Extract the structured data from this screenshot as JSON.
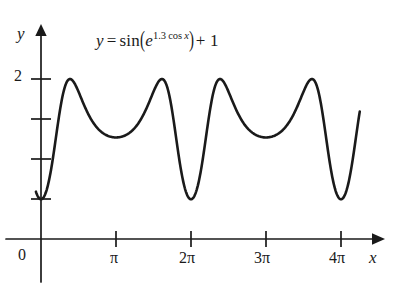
{
  "figure": {
    "kind": "function-graph",
    "background_color": "#ffffff",
    "ink_color": "#1a1a1a",
    "equation": {
      "lhs": "y",
      "relation": "=",
      "function_name": "sin",
      "inner_base": "e",
      "inner_exponent_coefficient": "1.3",
      "inner_exponent_function": "cos",
      "inner_exponent_variable": "x",
      "added_constant": "+ 1",
      "plain_text": "y = sin(e^{1.3 cos x}) + 1"
    },
    "axes": {
      "x_axis_label": "x",
      "y_axis_label": "y",
      "origin_label": "0",
      "x_ticks": [
        {
          "label": "π",
          "value_in_pi": 1
        },
        {
          "label": "2π",
          "value_in_pi": 2
        },
        {
          "label": "3π",
          "value_in_pi": 3
        },
        {
          "label": "4π",
          "value_in_pi": 4
        }
      ],
      "y_ticks": [
        {
          "label": "2",
          "value": 2
        },
        {
          "label": "",
          "value": 1.5
        },
        {
          "label": "",
          "value": 1.0
        },
        {
          "label": "",
          "value": 0.5
        }
      ],
      "x_range_pi": [
        -0.07,
        4.5
      ],
      "y_range": [
        0,
        2.6
      ]
    }
  },
  "chart_data": {
    "type": "line",
    "xlabel": "x",
    "ylabel": "y",
    "xlim_pi": [
      -0.07,
      4.5
    ],
    "ylim": [
      0,
      2.6
    ],
    "grid": false,
    "legend": null,
    "xtick_labels": [
      "0",
      "π",
      "2π",
      "3π",
      "4π"
    ],
    "xtick_values_pi": [
      0,
      1,
      2,
      3,
      4
    ],
    "ytick_labels": [
      "2"
    ],
    "ytick_values": [
      2,
      1.5,
      1.0,
      0.5
    ],
    "formula": "sin(exp(1.3*cos(x))) + 1",
    "domain_pi": [
      -0.068,
      4.25
    ],
    "samples": 600,
    "features": {
      "maxima_y": 2.0,
      "maxima_x_pi": [
        0.46,
        1.54,
        2.46,
        3.54
      ],
      "deep_minima_y": 0.43,
      "deep_minima_x_pi": [
        0,
        2,
        4
      ],
      "shallow_minima_y": 1.26,
      "shallow_minima_x_pi": [
        1,
        3
      ],
      "left_endpoint": {
        "x_pi": -0.068,
        "y": 1.5
      },
      "right_endpoint": {
        "x_pi": 4.25,
        "y": 1.62
      }
    },
    "series": [
      {
        "name": "y = sin(e^{1.3 cos x}) + 1",
        "color": "#1a1a1a",
        "linewidth": 2.6
      }
    ]
  }
}
